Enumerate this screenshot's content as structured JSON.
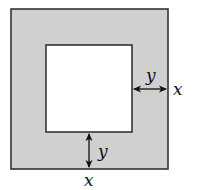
{
  "diagram": {
    "outer_square": {
      "x": 11,
      "y": 9,
      "width": 157,
      "height": 160,
      "fill": "#d0d0d0",
      "stroke": "#333333"
    },
    "inner_square": {
      "x": 46,
      "y": 45,
      "width": 86,
      "height": 87,
      "fill": "#ffffff",
      "stroke": "#333333"
    },
    "labels": {
      "right_gap": "y",
      "right_side": "x",
      "bottom_gap": "y",
      "bottom_side": "x"
    },
    "colors": {
      "shade": "#d0d0d0",
      "stroke": "#333333",
      "background": "#ffffff"
    }
  }
}
